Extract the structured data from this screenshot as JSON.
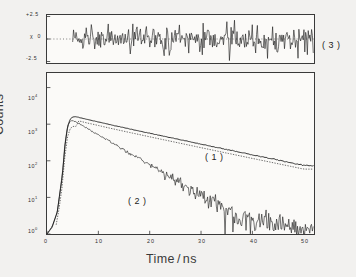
{
  "figure": {
    "kind": "tcspc-fluorescence-decay",
    "background_color": "#f2f1ef",
    "panel_color": "#fbfaf8",
    "axis_color": "#3a3a3a",
    "trace_color": "#1a1a1a"
  },
  "axes": {
    "x": {
      "label_prefix": "Time",
      "label_slash": "/",
      "label_unit": "ns",
      "label_full": "Time / ns",
      "ticks": [
        "0",
        "10",
        "20",
        "30",
        "40",
        "50"
      ],
      "tick_values": [
        0,
        10,
        20,
        30,
        40,
        50
      ],
      "range": [
        0,
        52
      ]
    },
    "y": {
      "label": "Counts",
      "scale": "log10",
      "ticks": [
        "10⁰",
        "10¹",
        "10²",
        "10³",
        "10⁴"
      ],
      "tick_mantissa": "10",
      "tick_exponents": [
        "0",
        "1",
        "2",
        "3",
        "4"
      ],
      "range_decades": [
        0,
        4.4
      ]
    }
  },
  "residual_panel": {
    "name": "weighted-residuals",
    "symbol": "χ",
    "tick_top": "+2.5",
    "tick_mid_symbol": "χ",
    "tick_mid": "0",
    "tick_bot": "-2.5",
    "zero_line_style": "dotted",
    "range": [
      -2.5,
      2.5
    ],
    "panel_label": "( 3 )"
  },
  "annotations": {
    "curve1": "( 1 )",
    "curve2": "( 2 )",
    "panel3": "( 3 )"
  },
  "chart_data": {
    "type": "line",
    "title": "",
    "xlabel": "Time / ns",
    "ylabel": "Counts",
    "yscale": "log10",
    "ylim": [
      1,
      25000
    ],
    "xlim": [
      0,
      52
    ],
    "grid": false,
    "legend": "inline-annotations",
    "series": [
      {
        "name": "( 1 )",
        "description": "slow fluorescence decay, long lifetime",
        "style": "solid-with-dotted-overlay",
        "lifetime_ns": 12.0,
        "peak_counts": 1600,
        "peak_time_ns": 5.5,
        "x": [
          0,
          1,
          2,
          3,
          3.5,
          4,
          4.5,
          5,
          5.5,
          6,
          7,
          8,
          9,
          10,
          12,
          14,
          16,
          18,
          20,
          22,
          24,
          26,
          28,
          30,
          32,
          34,
          36,
          38,
          40,
          42,
          44,
          46,
          48,
          50
        ],
        "y": [
          1,
          1.6,
          4,
          40,
          260,
          820,
          1380,
          1570,
          1600,
          1560,
          1440,
          1330,
          1240,
          1150,
          990,
          860,
          745,
          650,
          565,
          492,
          430,
          375,
          327,
          285,
          249,
          217,
          190,
          166,
          145,
          127,
          111,
          97,
          85,
          74
        ]
      },
      {
        "name": "( 2 )",
        "description": "fast quenched decay with Poisson noise tail",
        "style": "noisy-solid",
        "lifetime_ns": 6.0,
        "peak_counts": 1250,
        "peak_time_ns": 5.0,
        "x": [
          0,
          1,
          2,
          3,
          3.5,
          4,
          4.5,
          5,
          5.5,
          6,
          7,
          8,
          9,
          10,
          12,
          14,
          16,
          18,
          20,
          22,
          24,
          26,
          28,
          30,
          32,
          34,
          36,
          38,
          40,
          42,
          44,
          46,
          48,
          50
        ],
        "y": [
          1,
          1.5,
          4,
          45,
          300,
          900,
          1220,
          1250,
          1190,
          1090,
          900,
          745,
          615,
          510,
          350,
          240,
          165,
          113,
          78,
          53,
          37,
          25,
          17,
          12,
          8,
          6,
          4,
          3,
          2.4,
          2,
          1.7,
          1.5,
          1.3,
          1.2
        ]
      }
    ],
    "residuals": {
      "name": "( 3 )",
      "description": "weighted residuals, randomly distributed about zero",
      "ylim": [
        -2.5,
        2.5
      ],
      "zero_line": 0,
      "start_time_ns": 5.0
    }
  }
}
